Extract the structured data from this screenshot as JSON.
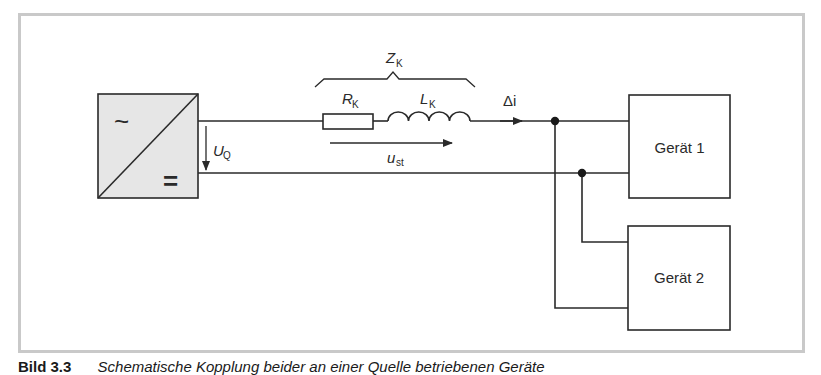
{
  "figure": {
    "caption_number": "Bild 3.3",
    "caption_text": "Schematische Kopplung beider an einer Quelle betriebenen Geräte"
  },
  "source": {
    "ac_symbol": "~",
    "dc_symbol": "=",
    "voltage_label": "U",
    "voltage_sub": "Q"
  },
  "coupling_impedance": {
    "label": "Z",
    "label_sub": "K",
    "resistor_label": "R",
    "resistor_sub": "K",
    "inductor_label": "L",
    "inductor_sub": "K",
    "voltage_drop_label": "u",
    "voltage_drop_sub": "st"
  },
  "current": {
    "label": "Δi"
  },
  "devices": [
    {
      "label": "Gerät 1"
    },
    {
      "label": "Gerät 2"
    }
  ],
  "colors": {
    "line": "#2a2a2a",
    "source_fill": "#e6e6e6",
    "frame": "#c9c9c9"
  }
}
